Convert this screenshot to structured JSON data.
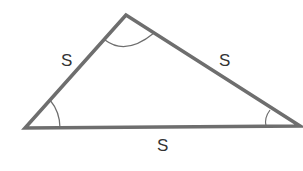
{
  "diagram": {
    "type": "triangle",
    "stroke_color": "#6e6e6e",
    "vertices": {
      "top": [
        126,
        15
      ],
      "left": [
        25,
        128
      ],
      "right": [
        300,
        126
      ]
    },
    "side_labels": {
      "left": "S",
      "right": "S",
      "bottom": "S"
    },
    "angle_marks": [
      "top",
      "left",
      "right"
    ]
  }
}
